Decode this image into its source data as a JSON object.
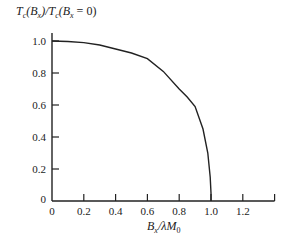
{
  "chart_data": {
    "type": "line",
    "title": "",
    "ylabel": "T_c(B_x)/T_c(B_x = 0)",
    "xlabel": "B_x/λM_0",
    "xlim": [
      0,
      1.4
    ],
    "ylim": [
      0,
      1.1
    ],
    "grid": false,
    "legend": null,
    "x_ticks": [
      "0",
      "0.2",
      "0.4",
      "0.6",
      "0.8",
      "1.0",
      "1.2"
    ],
    "y_ticks": [
      "0",
      "0.2",
      "0.4",
      "0.6",
      "0.8",
      "1.0"
    ],
    "series": [
      {
        "name": "Tc ratio",
        "x": [
          0.0,
          0.1,
          0.2,
          0.3,
          0.4,
          0.5,
          0.6,
          0.7,
          0.8,
          0.85,
          0.9,
          0.95,
          0.98,
          0.995,
          1.0,
          1.0
        ],
        "y": [
          1.0,
          0.997,
          0.99,
          0.975,
          0.95,
          0.925,
          0.89,
          0.81,
          0.7,
          0.65,
          0.59,
          0.45,
          0.3,
          0.15,
          0.05,
          0.0
        ]
      }
    ]
  },
  "labels": {
    "y_axis": {
      "main": "T",
      "sub1": "c",
      "mid1": "(B",
      "sub2": "x",
      "mid2": ")/T",
      "sub3": "c",
      "mid3": "(B",
      "sub4": "x",
      "end": " = 0)"
    },
    "x_axis": {
      "main": "B",
      "sub1": "x",
      "mid": "/λM",
      "sub2": "0"
    }
  }
}
